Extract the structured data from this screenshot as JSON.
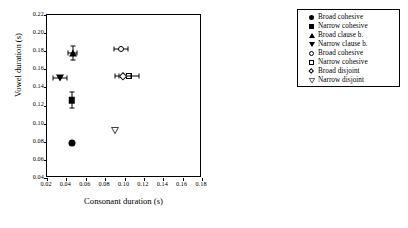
{
  "chart_data": {
    "type": "scatter",
    "title": "",
    "xlabel": "Consonant duration (s)",
    "ylabel": "Vowel duration (s)",
    "xlim": [
      0.02,
      0.18
    ],
    "ylim": [
      0.04,
      0.22
    ],
    "xticks": [
      "0.02",
      "0.04",
      "0.06",
      "0.08",
      "0.10",
      "0.12",
      "0.14",
      "0.16",
      "0.18"
    ],
    "yticks": [
      "0.04",
      "0.06",
      "0.08",
      "0.10",
      "0.12",
      "0.14",
      "0.16",
      "0.18",
      "0.20",
      "0.22"
    ],
    "grid": false,
    "legend_position": "right-outside",
    "series": [
      {
        "name": "Broad cohesive",
        "marker": "circle-filled",
        "x": 0.0455,
        "y": 0.0785,
        "xerr": 0.0,
        "yerr": 0.0
      },
      {
        "name": "Narrow cohesive",
        "marker": "square-filled",
        "x": 0.0455,
        "y": 0.126,
        "xerr": 0.0018,
        "yerr": 0.0088
      },
      {
        "name": "Broad clause b.",
        "marker": "triangle-up-filled",
        "x": 0.0465,
        "y": 0.178,
        "xerr": 0.0048,
        "yerr": 0.0078
      },
      {
        "name": "Narrow clause b.",
        "marker": "triangle-down-filled",
        "x": 0.0335,
        "y": 0.1505,
        "xerr": 0.0075,
        "yerr": 0.0
      },
      {
        "name": "Broad cohesive",
        "marker": "circle-open",
        "x": 0.0965,
        "y": 0.1825,
        "xerr": 0.0075,
        "yerr": 0.0
      },
      {
        "name": "Narrow cohesive",
        "marker": "square-open",
        "x": 0.1045,
        "y": 0.1525,
        "xerr": 0.0105,
        "yerr": 0.0
      },
      {
        "name": "Broad disjoint",
        "marker": "diamond-open",
        "x": 0.0985,
        "y": 0.1525,
        "xerr": 0.0078,
        "yerr": 0.0
      },
      {
        "name": "Narrow disjoint",
        "marker": "triangle-down-open",
        "x": 0.0945,
        "y": 0.0885,
        "xerr": 0.0,
        "yerr": 0.0
      }
    ]
  },
  "legend": {
    "items": [
      {
        "label": "Broad cohesive",
        "marker": "circle-filled"
      },
      {
        "label": "Narrow cohesive",
        "marker": "square-filled"
      },
      {
        "label": "Broad clause b.",
        "marker": "triangle-up-filled"
      },
      {
        "label": "Narrow clause b.",
        "marker": "triangle-down-filled"
      },
      {
        "label": "Broad cohesive",
        "marker": "circle-open"
      },
      {
        "label": "Narrow cohesive",
        "marker": "square-open"
      },
      {
        "label": "Broad disjoint",
        "marker": "diamond-open"
      },
      {
        "label": "Narrow disjoint",
        "marker": "triangle-down-open"
      }
    ]
  }
}
